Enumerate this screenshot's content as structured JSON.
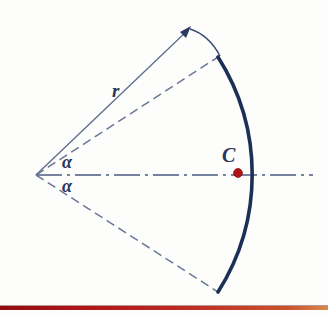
{
  "figure": {
    "canvas": {
      "width": 328,
      "height": 315,
      "background": "#fdfdfc"
    },
    "labels": {
      "radius": "r",
      "angle_upper": "α",
      "angle_lower": "α",
      "centroid": "C"
    },
    "colors": {
      "arc": "#1c2f55",
      "thin_line": "#5d6c8c",
      "dashed_line": "#6a7896",
      "axis": "#4a5a80",
      "label_text": "#27355c",
      "centroid_dot": "#b01418",
      "centroid_dot_edge": "#7d0d10",
      "bottom_rule": "#a81316"
    },
    "geometry": {
      "apex": {
        "x": 36,
        "y": 175
      },
      "arc_radius": 219,
      "arc_endpoint_top": {
        "x": 218,
        "y": 57
      },
      "arc_endpoint_bottom": {
        "x": 218,
        "y": 292
      },
      "arc_vertex_on_axis": {
        "x": 255,
        "y": 175
      },
      "arc_stroke_width": 3.6,
      "half_angle_deg": 32,
      "centroid_dot": {
        "x": 238,
        "y": 173,
        "radius": 4.4
      },
      "axis_left": {
        "x": 36,
        "y": 175
      },
      "axis_right": {
        "x": 313,
        "y": 175
      },
      "dimension_arrow_tip": {
        "x": 190,
        "y": 28
      },
      "dimension_tick_end": {
        "x": 222,
        "y": 55
      },
      "label_positions": {
        "radius": {
          "x": 112,
          "y": 80
        },
        "angle_upper": {
          "x": 62,
          "y": 152
        },
        "angle_lower": {
          "x": 62,
          "y": 176
        },
        "centroid": {
          "x": 222,
          "y": 144
        }
      },
      "bottom_rule": {
        "y": 306,
        "height": 4
      }
    }
  }
}
